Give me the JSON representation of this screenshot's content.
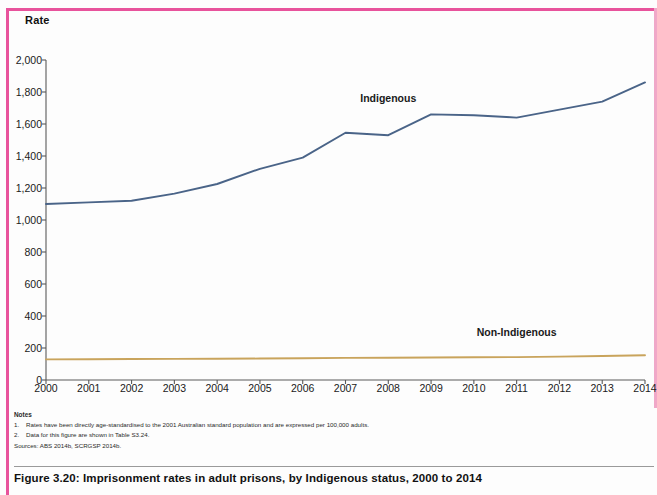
{
  "figure": {
    "caption": "Figure 3.20: Imprisonment rates in adult prisons, by Indigenous status, 2000 to 2014",
    "notes_heading": "Notes",
    "notes": [
      {
        "num": "1.",
        "text": "Rates have been directly age-standardised to the 2001 Australian standard population and are expressed per 100,000 adults."
      },
      {
        "num": "2.",
        "text": "Data for this figure are shown in Table S3.24."
      }
    ],
    "sources": "Sources: ABS 2014b, SCRGSP 2014b."
  },
  "chart_data": {
    "type": "line",
    "title": "Imprisonment rates in adult prisons, by Indigenous status, 2000 to 2014",
    "xlabel": "",
    "ylabel": "Rate",
    "ylim": [
      0,
      2000
    ],
    "ytick_step": 200,
    "grid": false,
    "legend_position": "inline-labels",
    "x": [
      2000,
      2001,
      2002,
      2003,
      2004,
      2005,
      2006,
      2007,
      2008,
      2009,
      2010,
      2011,
      2012,
      2013,
      2014
    ],
    "categories": [
      "2000",
      "2001",
      "2002",
      "2003",
      "2004",
      "2005",
      "2006",
      "2007",
      "2008",
      "2009",
      "2010",
      "2011",
      "2012",
      "2013",
      "2014"
    ],
    "ytick_labels": [
      "0",
      "200",
      "400",
      "600",
      "800",
      "1,000",
      "1,200",
      "1,400",
      "1,600",
      "1,800",
      "2,000"
    ],
    "ytick_values": [
      0,
      200,
      400,
      600,
      800,
      1000,
      1200,
      1400,
      1600,
      1800,
      2000
    ],
    "series": [
      {
        "name": "Indigenous",
        "color": "#4a6488",
        "label_x": 2008,
        "label_y": 1760,
        "values": [
          1100,
          1110,
          1120,
          1165,
          1225,
          1320,
          1390,
          1545,
          1530,
          1660,
          1655,
          1640,
          1690,
          1740,
          1860
        ]
      },
      {
        "name": "Non-Indigenous",
        "color": "#c9a45c",
        "label_x": 2011,
        "label_y": 300,
        "values": [
          129,
          130,
          131,
          132,
          133,
          134,
          136,
          138,
          139,
          141,
          142,
          143,
          146,
          150,
          155
        ]
      }
    ]
  }
}
